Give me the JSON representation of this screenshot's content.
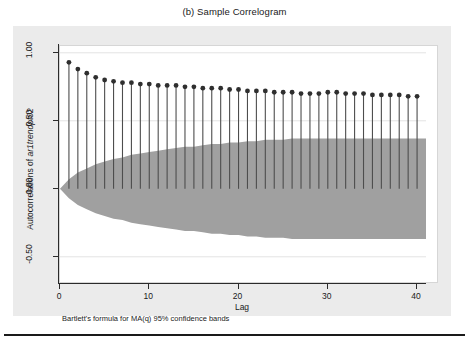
{
  "figure": {
    "title": "(b) Sample Correlogram",
    "note": "Bartlett's formula for MA(q) 95% confidence bands"
  },
  "chart_data": {
    "type": "line",
    "subtype": "stem-correlogram",
    "title": "(b) Sample Correlogram",
    "xlabel": "Lag",
    "ylabel": "Autocorrelations of ar1trendpt02",
    "ylabel_variable": "ar1trendpt02",
    "xlim": [
      0,
      41
    ],
    "ylim": [
      -0.7,
      1.05
    ],
    "xticks": [
      0,
      10,
      20,
      30,
      40
    ],
    "xtick_labels": [
      "0",
      "10",
      "20",
      "30",
      "40"
    ],
    "yticks": [
      -0.5,
      0.0,
      0.5,
      1.0
    ],
    "ytick_labels": [
      "-0.50",
      "0.00",
      "0.50",
      "1.00"
    ],
    "grid": true,
    "legend": null,
    "annotation": "Bartlett's formula for MA(q) 95% confidence bands",
    "x": [
      1,
      2,
      3,
      4,
      5,
      6,
      7,
      8,
      9,
      10,
      11,
      12,
      13,
      14,
      15,
      16,
      17,
      18,
      19,
      20,
      21,
      22,
      23,
      24,
      25,
      26,
      27,
      28,
      29,
      30,
      31,
      32,
      33,
      34,
      35,
      36,
      37,
      38,
      39,
      40
    ],
    "values": [
      0.93,
      0.88,
      0.85,
      0.82,
      0.8,
      0.79,
      0.78,
      0.78,
      0.77,
      0.77,
      0.76,
      0.76,
      0.76,
      0.75,
      0.75,
      0.74,
      0.74,
      0.74,
      0.73,
      0.73,
      0.72,
      0.72,
      0.72,
      0.71,
      0.71,
      0.71,
      0.7,
      0.7,
      0.7,
      0.71,
      0.71,
      0.7,
      0.7,
      0.7,
      0.69,
      0.69,
      0.69,
      0.69,
      0.68,
      0.68
    ],
    "confidence_band": {
      "label": "95% confidence band (Bartlett)",
      "color": "#a0a0a0",
      "upper": [
        0.07,
        0.12,
        0.15,
        0.18,
        0.2,
        0.22,
        0.23,
        0.25,
        0.26,
        0.27,
        0.28,
        0.29,
        0.3,
        0.31,
        0.31,
        0.32,
        0.33,
        0.33,
        0.34,
        0.34,
        0.35,
        0.35,
        0.36,
        0.36,
        0.36,
        0.37,
        0.37,
        0.37,
        0.37,
        0.37,
        0.37,
        0.37,
        0.37,
        0.37,
        0.37,
        0.37,
        0.37,
        0.37,
        0.37,
        0.37
      ],
      "lower": [
        -0.07,
        -0.12,
        -0.15,
        -0.18,
        -0.2,
        -0.22,
        -0.23,
        -0.25,
        -0.26,
        -0.27,
        -0.28,
        -0.29,
        -0.3,
        -0.31,
        -0.31,
        -0.32,
        -0.33,
        -0.33,
        -0.34,
        -0.34,
        -0.35,
        -0.35,
        -0.36,
        -0.36,
        -0.36,
        -0.37,
        -0.37,
        -0.37,
        -0.37,
        -0.37,
        -0.37,
        -0.37,
        -0.37,
        -0.37,
        -0.37,
        -0.37,
        -0.37,
        -0.37,
        -0.37,
        -0.37
      ]
    },
    "colors": {
      "marker": "#2f2f2f",
      "stem": "#4d4d4d",
      "band": "#a0a0a0",
      "panel": "#ebebeb",
      "plot_background": "#ffffff",
      "grid": "#e3e3e3",
      "axis": "#2b2b2b"
    }
  }
}
